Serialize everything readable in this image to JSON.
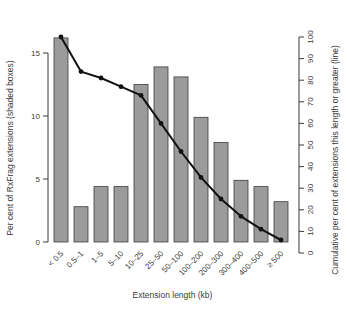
{
  "chart_data": {
    "type": "bar",
    "categories": [
      "< 0.5",
      "0.5–1",
      "1–5",
      "5–10",
      "10–25",
      "25–50",
      "50–100",
      "100–200",
      "200–300",
      "300–400",
      "400–500",
      "≥ 500"
    ],
    "series": [
      {
        "name": "Per cent of RxFrag extensions (shaded boxes)",
        "type": "bar",
        "axis": "left",
        "values": [
          16.2,
          2.8,
          4.4,
          4.4,
          12.5,
          13.9,
          13.1,
          9.9,
          7.9,
          4.9,
          4.4,
          3.2
        ]
      },
      {
        "name": "Cumulative per cent of extensions this length or greater (line)",
        "type": "line",
        "axis": "right",
        "values": [
          100,
          84,
          81,
          77,
          73,
          60,
          47,
          35,
          25,
          17,
          11,
          6
        ]
      }
    ],
    "xlabel": "Extension length (kb)",
    "ylabel_left": "Per cent of RxFrag extensions (shaded boxes)",
    "ylabel_right": "Cumulative per cent of extensions this length or greater (line)",
    "ylim_left": [
      0,
      15
    ],
    "yticks_left": [
      0,
      5,
      10,
      15
    ],
    "ylim_right": [
      0,
      100
    ],
    "yticks_right": [
      0,
      10,
      20,
      30,
      40,
      50,
      60,
      70,
      80,
      90,
      100
    ],
    "grid": false,
    "legend": "none",
    "colors": {
      "bar_fill": "#9b9b9b",
      "bar_border": "#3d3d3d",
      "line": "#111111",
      "marker": "#111111",
      "axis": "#3a3a3a",
      "text": "#3a3a3a"
    }
  }
}
